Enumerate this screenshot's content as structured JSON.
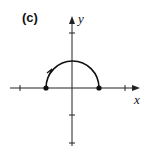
{
  "figure": {
    "panel_label": "(c)",
    "x_axis_label": "x",
    "y_axis_label": "y",
    "curve": "upper semicircle from (-1,0) to (1,0)",
    "orientation_arrow": "counterclockwise starting at left endpoint",
    "endpoints": [
      [
        -1,
        0
      ],
      [
        1,
        0
      ]
    ],
    "colors": {
      "ink": "#111111",
      "background": "#ffffff"
    }
  }
}
